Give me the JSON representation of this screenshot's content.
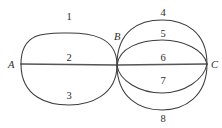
{
  "figure": {
    "kind": "multigraph-diagram",
    "background_color": "#ffffff",
    "stroke_color": "#3c3c3c",
    "label_color": "#2b2b2b",
    "width": 222,
    "height": 128
  },
  "vertices": [
    {
      "id": "A",
      "label": "A",
      "x": 21,
      "y": 64,
      "label_x": 8,
      "label_y": 68
    },
    {
      "id": "B",
      "label": "B",
      "x": 117,
      "y": 65,
      "label_x": 114,
      "label_y": 40
    },
    {
      "id": "C",
      "label": "C",
      "x": 207,
      "y": 64,
      "label_x": 211,
      "label_y": 68
    }
  ],
  "edges": [
    {
      "label": "1",
      "from": "A",
      "to": "B",
      "shape": "arc-upper-outer",
      "path": "M 21 64 C 21 30 49 33 69 33 C 89 33 117 36 117 65",
      "label_x": 69,
      "label_y": 20
    },
    {
      "label": "2",
      "from": "A",
      "to": "B",
      "shape": "straight",
      "path": "M 21 64 L 117 65",
      "label_x": 69,
      "label_y": 61
    },
    {
      "label": "3",
      "from": "A",
      "to": "B",
      "shape": "arc-lower-outer",
      "path": "M 21 64 C 21 98 49 105 69 105 C 89 105 117 96 117 65",
      "label_x": 69,
      "label_y": 99
    },
    {
      "label": "4",
      "from": "B",
      "to": "C",
      "shape": "arc-upper-outer",
      "path": "M 117 65 C 117 30 140 20 162 20 C 184 20 207 31 207 64",
      "label_x": 163,
      "label_y": 16
    },
    {
      "label": "5",
      "from": "B",
      "to": "C",
      "shape": "arc-upper-inner",
      "path": "M 117 65 C 119 48 140 40 162 40 C 184 40 204 50 207 64",
      "label_x": 163,
      "label_y": 37
    },
    {
      "label": "6",
      "from": "B",
      "to": "C",
      "shape": "straight",
      "path": "M 117 65 L 207 64",
      "label_x": 163,
      "label_y": 61
    },
    {
      "label": "7",
      "from": "B",
      "to": "C",
      "shape": "arc-lower-inner",
      "path": "M 117 65 C 119 81 140 93 162 93 C 184 93 204 80 207 64",
      "label_x": 163,
      "label_y": 84
    },
    {
      "label": "8",
      "from": "B",
      "to": "C",
      "shape": "arc-lower-outer",
      "path": "M 117 65 C 117 98 140 110 162 110 C 184 110 207 97 207 64",
      "label_x": 163,
      "label_y": 122
    }
  ]
}
